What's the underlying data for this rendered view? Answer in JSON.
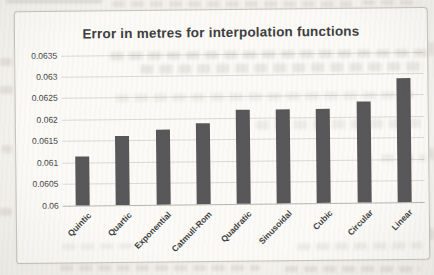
{
  "chart_data": {
    "type": "bar",
    "title": "Error in metres for interpolation functions",
    "categories": [
      "Quintic",
      "Quartic",
      "Exponential",
      "Catmull-Rom",
      "Quadratic",
      "Sinusoidal",
      "Cubic",
      "Circular",
      "Linear"
    ],
    "values": [
      0.06115,
      0.0616,
      0.06175,
      0.0619,
      0.0622,
      0.0622,
      0.0622,
      0.06235,
      0.0629
    ],
    "xlabel": "",
    "ylabel": "",
    "ylim": [
      0.06,
      0.0635
    ],
    "ytick_step": 0.0005,
    "ytick_labels": [
      "0.06",
      "0.0605",
      "0.061",
      "0.0615",
      "0.062",
      "0.0625",
      "0.063",
      "0.0635"
    ],
    "grid": true,
    "legend": null,
    "bar_color": "#57575a",
    "gridline_color": "#dbd9d4",
    "axis_line_color": "#b7b5b0",
    "title_color": "#3e3e3e",
    "tick_label_color": "#3e3e3e",
    "chart_background": "#fbfaf7",
    "chart_border_color": "#c6c4bf"
  }
}
